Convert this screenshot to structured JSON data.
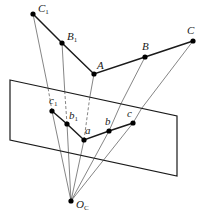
{
  "diagram": {
    "type": "perspective-projection",
    "colors": {
      "stroke": "#1a1a1a",
      "ray": "#333333",
      "point": "#000000",
      "background": "#ffffff"
    },
    "points_3d": [
      {
        "id": "C1",
        "label": "C",
        "sub": "1",
        "x": 33,
        "y": 14
      },
      {
        "id": "B1",
        "label": "B",
        "sub": "1",
        "x": 62,
        "y": 43
      },
      {
        "id": "A",
        "label": "A",
        "sub": "",
        "x": 94,
        "y": 74
      },
      {
        "id": "B",
        "label": "B",
        "sub": "",
        "x": 145,
        "y": 57
      },
      {
        "id": "C",
        "label": "C",
        "sub": "",
        "x": 193,
        "y": 41
      }
    ],
    "points_image": [
      {
        "id": "c1",
        "label": "c",
        "sub": "1",
        "x": 52,
        "y": 111
      },
      {
        "id": "b1",
        "label": "b",
        "sub": "1",
        "x": 67,
        "y": 124
      },
      {
        "id": "a",
        "label": "a",
        "sub": "",
        "x": 84,
        "y": 140
      },
      {
        "id": "b",
        "label": "b",
        "sub": "",
        "x": 109,
        "y": 131
      },
      {
        "id": "c",
        "label": "c",
        "sub": "",
        "x": 133,
        "y": 123
      }
    ],
    "camera_center": {
      "id": "Oc",
      "label": "O",
      "sub": "C",
      "x": 71,
      "y": 201
    },
    "image_plane": {
      "corners": [
        [
          10,
          80
        ],
        [
          177,
          116
        ],
        [
          177,
          176
        ],
        [
          10,
          140
        ]
      ]
    }
  }
}
